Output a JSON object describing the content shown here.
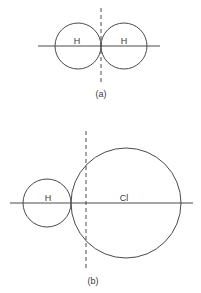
{
  "figure_a": {
    "caption": "(a)",
    "atoms": [
      {
        "label": "H",
        "cx": 78,
        "cy": 46,
        "r": 23
      },
      {
        "label": "H",
        "cx": 124,
        "cy": 46,
        "r": 23
      }
    ],
    "axis": {
      "x1": 38,
      "x2": 160,
      "y": 46
    },
    "divider": {
      "x": 101,
      "y1": 8,
      "y2": 82
    }
  },
  "figure_b": {
    "caption": "(b)",
    "atoms": [
      {
        "label": "H",
        "cx": 47,
        "cy": 203,
        "r": 24
      },
      {
        "label": "Cl",
        "cx": 126,
        "cy": 203,
        "r": 55
      }
    ],
    "axis": {
      "x1": 10,
      "x2": 193,
      "y": 203
    },
    "divider": {
      "x": 86,
      "y1": 131,
      "y2": 270
    }
  }
}
